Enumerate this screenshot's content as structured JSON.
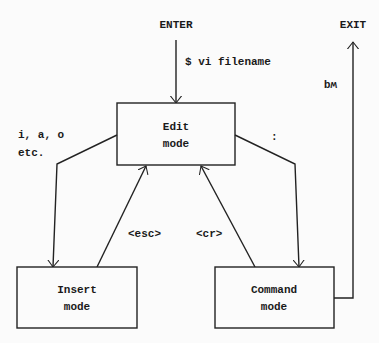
{
  "diagram": {
    "terminals": {
      "enter": "ENTER",
      "exit": "EXIT"
    },
    "nodes": [
      {
        "id": "edit",
        "line1": "Edit",
        "line2": "mode"
      },
      {
        "id": "insert",
        "line1": "Insert",
        "line2": "mode"
      },
      {
        "id": "command",
        "line1": "Command",
        "line2": "mode"
      }
    ],
    "edges": [
      {
        "from": "ENTER",
        "to": "edit",
        "label": "$ vi filename"
      },
      {
        "from": "edit",
        "to": "insert",
        "label_line1": "i, a, o",
        "label_line2": "etc."
      },
      {
        "from": "insert",
        "to": "edit",
        "label": "<esc>"
      },
      {
        "from": "edit",
        "to": "command",
        "label": ":"
      },
      {
        "from": "command",
        "to": "edit",
        "label": "<cr>"
      },
      {
        "from": "command",
        "to": "EXIT",
        "label": "wq"
      }
    ]
  }
}
